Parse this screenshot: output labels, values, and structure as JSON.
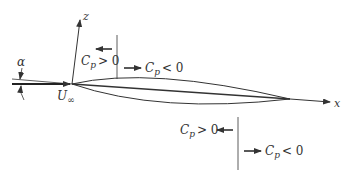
{
  "diagram": {
    "type": "airfoil pressure coefficient sketch",
    "axes": {
      "x_label": "x",
      "z_label": "z"
    },
    "freestream": {
      "symbol": "U",
      "subscript": "∞"
    },
    "angle": {
      "symbol": "α"
    },
    "upper_surface": {
      "left_region": {
        "symbol": "C",
        "subscript": "p",
        "relation": "> 0"
      },
      "right_region": {
        "symbol": "C",
        "subscript": "p",
        "relation": "< 0"
      }
    },
    "lower_surface": {
      "left_region": {
        "symbol": "C",
        "subscript": "p",
        "relation": "> 0"
      },
      "right_region": {
        "symbol": "C",
        "subscript": "p",
        "relation": "< 0"
      }
    },
    "colors": {
      "line": "#333333",
      "background": "#ffffff"
    }
  }
}
